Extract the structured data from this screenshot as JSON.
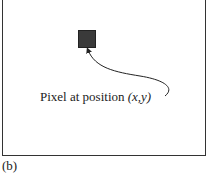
{
  "diagram": {
    "label_prefix": "Pixel at position ",
    "label_math": "(x,y)",
    "caption": "(b)",
    "colors": {
      "pixel": "#3a3a3a",
      "border": "#333333",
      "text": "#222222"
    }
  }
}
